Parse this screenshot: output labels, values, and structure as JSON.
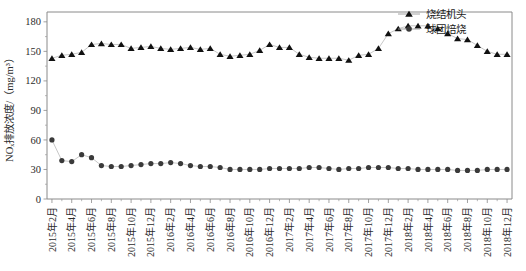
{
  "chart_data": {
    "type": "line",
    "title": "",
    "xlabel": "",
    "ylabel": "NOₓ排放浓度/（mg/m³）",
    "ylim": [
      0,
      190
    ],
    "yticks": [
      0,
      30,
      60,
      90,
      120,
      150,
      180
    ],
    "grid": false,
    "legend_position": "top-right",
    "x": [
      "2015年2月",
      "2015年3月",
      "2015年4月",
      "2015年5月",
      "2015年6月",
      "2015年7月",
      "2015年8月",
      "2015年9月",
      "2015年10月",
      "2015年11月",
      "2015年12月",
      "2016年1月",
      "2016年2月",
      "2016年3月",
      "2016年4月",
      "2016年5月",
      "2016年6月",
      "2016年7月",
      "2016年8月",
      "2016年9月",
      "2016年10月",
      "2016年11月",
      "2016年12月",
      "2017年1月",
      "2017年2月",
      "2017年3月",
      "2017年4月",
      "2017年5月",
      "2017年6月",
      "2017年7月",
      "2017年8月",
      "2017年9月",
      "2017年10月",
      "2017年11月",
      "2017年12月",
      "2018年1月",
      "2018年2月",
      "2018年3月",
      "2018年4月",
      "2018年5月",
      "2018年6月",
      "2018年7月",
      "2018年8月",
      "2018年9月",
      "2018年10月",
      "2018年11月",
      "2018年12月"
    ],
    "xtick_labels": [
      "2015年2月",
      "2015年4月",
      "2015年6月",
      "2015年8月",
      "2015年10月",
      "2015年12月",
      "2016年2月",
      "2016年4月",
      "2016年6月",
      "2016年8月",
      "2016年10月",
      "2016年12月",
      "2017年2月",
      "2017年4月",
      "2017年6月",
      "2017年8月",
      "2017年10月",
      "2017年12月",
      "2018年2月",
      "2018年4月",
      "2018年6月",
      "2018年8月",
      "2018年10月",
      "2018年12月"
    ],
    "xtick_indices": [
      0,
      2,
      4,
      6,
      8,
      10,
      12,
      14,
      16,
      18,
      20,
      22,
      24,
      26,
      28,
      30,
      32,
      34,
      36,
      38,
      40,
      42,
      44,
      46
    ],
    "series": [
      {
        "name": "烧结机头",
        "marker": "triangle",
        "color": "#111111",
        "values": [
          143,
          146,
          147,
          149,
          157,
          158,
          157,
          157,
          153,
          154,
          155,
          153,
          152,
          153,
          154,
          152,
          153,
          147,
          145,
          146,
          147,
          151,
          157,
          154,
          154,
          147,
          144,
          143,
          143,
          143,
          141,
          146,
          147,
          153,
          168,
          173,
          176,
          176,
          176,
          173,
          168,
          163,
          162,
          156,
          150,
          147,
          147
        ]
      },
      {
        "name": "球团焙烧",
        "marker": "circle",
        "color": "#3a3a3a",
        "values": [
          60,
          39,
          38,
          45,
          42,
          34,
          33,
          33,
          34,
          35,
          36,
          36,
          37,
          36,
          34,
          33,
          33,
          32,
          30,
          30,
          30,
          30,
          31,
          31,
          31,
          31,
          32,
          32,
          31,
          30,
          31,
          31,
          32,
          32,
          32,
          31,
          31,
          30,
          30,
          30,
          30,
          29,
          29,
          29,
          30,
          30,
          30
        ]
      }
    ],
    "series2_tail_note": ""
  },
  "legend": {
    "items": [
      {
        "label": "烧结机头",
        "marker": "triangle"
      },
      {
        "label": "球团焙烧",
        "marker": "circle"
      }
    ]
  }
}
